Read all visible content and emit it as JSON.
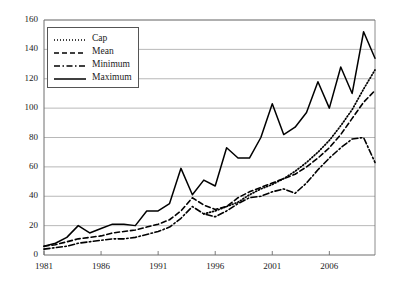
{
  "chart_data": {
    "type": "line",
    "title": "",
    "xlabel": "",
    "ylabel": "",
    "xlim": [
      1981,
      2010
    ],
    "ylim": [
      0,
      160
    ],
    "grid": true,
    "grid_axis": "y",
    "legend_position": "top-left",
    "x": [
      1981,
      1982,
      1983,
      1984,
      1985,
      1986,
      1987,
      1988,
      1989,
      1990,
      1991,
      1992,
      1993,
      1994,
      1995,
      1996,
      1997,
      1998,
      1999,
      2000,
      2001,
      2002,
      2003,
      2004,
      2005,
      2006,
      2007,
      2008,
      2009,
      2010
    ],
    "xticks": [
      1981,
      1986,
      1991,
      1996,
      2001,
      2006
    ],
    "xtick_labels": [
      "1981",
      "1986",
      "1991",
      "1996",
      "2001",
      "2006"
    ],
    "yticks": [
      0,
      20,
      40,
      60,
      80,
      100,
      120,
      140,
      160
    ],
    "ytick_labels": [
      "0",
      "20",
      "40",
      "60",
      "80",
      "100",
      "120",
      "140",
      "160"
    ],
    "series": [
      {
        "name": "Cap",
        "style": "dotted",
        "color": "#000000",
        "x": [
          1995,
          1996,
          1997,
          1998,
          1999,
          2000,
          2001,
          2002,
          2003,
          2004,
          2005,
          2006,
          2007,
          2008,
          2009,
          2010
        ],
        "values": [
          28,
          30,
          33,
          36,
          41,
          45,
          48,
          52,
          57,
          63,
          70,
          78,
          88,
          99,
          113,
          126
        ]
      },
      {
        "name": "Mean",
        "style": "dashed",
        "color": "#000000",
        "x": [
          1981,
          1982,
          1983,
          1984,
          1985,
          1986,
          1987,
          1988,
          1989,
          1990,
          1991,
          1992,
          1993,
          1994,
          1995,
          1996,
          1997,
          1998,
          1999,
          2000,
          2001,
          2002,
          2003,
          2004,
          2005,
          2006,
          2007,
          2008,
          2009,
          2010
        ],
        "values": [
          6,
          7,
          9,
          11,
          12,
          13,
          15,
          16,
          17,
          19,
          21,
          24,
          30,
          39,
          34,
          31,
          33,
          39,
          43,
          46,
          49,
          52,
          55,
          60,
          66,
          73,
          82,
          93,
          104,
          112
        ]
      },
      {
        "name": "Minimum",
        "style": "dashdot",
        "color": "#000000",
        "x": [
          1981,
          1982,
          1983,
          1984,
          1985,
          1986,
          1987,
          1988,
          1989,
          1990,
          1991,
          1992,
          1993,
          1994,
          1995,
          1996,
          1997,
          1998,
          1999,
          2000,
          2001,
          2002,
          2003,
          2004,
          2005,
          2006,
          2007,
          2008,
          2009,
          2010
        ],
        "values": [
          4,
          5,
          6,
          8,
          9,
          10,
          11,
          11,
          12,
          14,
          16,
          19,
          25,
          33,
          28,
          26,
          30,
          35,
          39,
          40,
          43,
          45,
          42,
          49,
          58,
          66,
          73,
          79,
          80,
          63
        ]
      },
      {
        "name": "Maximum",
        "style": "solid",
        "color": "#000000",
        "x": [
          1981,
          1982,
          1983,
          1984,
          1985,
          1986,
          1987,
          1988,
          1989,
          1990,
          1991,
          1992,
          1993,
          1994,
          1995,
          1996,
          1997,
          1998,
          1999,
          2000,
          2001,
          2002,
          2003,
          2004,
          2005,
          2006,
          2007,
          2008,
          2009,
          2010
        ],
        "values": [
          6,
          8,
          12,
          20,
          15,
          18,
          21,
          21,
          20,
          30,
          30,
          35,
          59,
          41,
          51,
          47,
          73,
          66,
          66,
          80,
          103,
          82,
          87,
          97,
          118,
          100,
          128,
          110,
          152,
          134
        ]
      }
    ]
  },
  "legend": {
    "items": [
      {
        "label": "Cap"
      },
      {
        "label": "Mean"
      },
      {
        "label": "Minimum"
      },
      {
        "label": "Maximum"
      }
    ]
  },
  "colors": {
    "line": "#000000",
    "grid": "#9a9a9a",
    "axis": "#6e6e6e",
    "background": "#ffffff"
  }
}
